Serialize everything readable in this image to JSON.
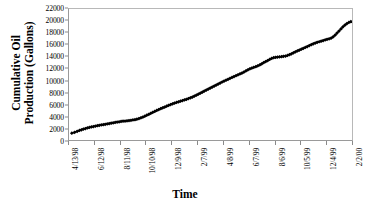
{
  "chart_data": {
    "type": "scatter",
    "title": "",
    "xlabel": "Time",
    "ylabel": "Cumulative Oil Production (Gallons)",
    "ylabel_lines": [
      "Cumulative Oil",
      "Production (Gallons)"
    ],
    "ylim": [
      0,
      22000
    ],
    "ytick_step": 2000,
    "yticks": [
      0,
      2000,
      4000,
      6000,
      8000,
      10000,
      12000,
      14000,
      16000,
      18000,
      20000,
      22000
    ],
    "ytick_labels": [
      "0",
      "2000",
      "4000",
      "6000",
      "8000",
      "10000",
      "12000",
      "14000",
      "16000",
      "18000",
      "20000",
      "22000"
    ],
    "xticks": [
      "4/13/98",
      "6/12/98",
      "8/11/98",
      "10/10/98",
      "12/9/98",
      "2/7/99",
      "4/8/99",
      "6/7/99",
      "8/6/99",
      "10/5/99",
      "12/4/99",
      "2/2/00"
    ],
    "xlim": [
      "4/13/98",
      "2/2/00"
    ],
    "grid": false,
    "legend": false,
    "marker": "filled-diamond",
    "marker_color": "#000000",
    "series": [
      {
        "name": "Cumulative Oil Production",
        "x_fraction": [
          0.01,
          0.02,
          0.029,
          0.037,
          0.044,
          0.051,
          0.058,
          0.065,
          0.072,
          0.079,
          0.086,
          0.093,
          0.1,
          0.107,
          0.114,
          0.121,
          0.128,
          0.135,
          0.142,
          0.149,
          0.156,
          0.163,
          0.17,
          0.177,
          0.184,
          0.191,
          0.198,
          0.205,
          0.212,
          0.219,
          0.226,
          0.233,
          0.24,
          0.247,
          0.254,
          0.261,
          0.268,
          0.275,
          0.282,
          0.289,
          0.296,
          0.303,
          0.31,
          0.317,
          0.324,
          0.331,
          0.338,
          0.345,
          0.352,
          0.359,
          0.366,
          0.373,
          0.38,
          0.387,
          0.394,
          0.401,
          0.408,
          0.415,
          0.422,
          0.429,
          0.436,
          0.443,
          0.45,
          0.457,
          0.464,
          0.471,
          0.478,
          0.485,
          0.492,
          0.499,
          0.506,
          0.513,
          0.52,
          0.527,
          0.534,
          0.541,
          0.548,
          0.555,
          0.562,
          0.569,
          0.576,
          0.583,
          0.59,
          0.597,
          0.604,
          0.611,
          0.618,
          0.625,
          0.632,
          0.639,
          0.646,
          0.653,
          0.66,
          0.667,
          0.674,
          0.681,
          0.688,
          0.695,
          0.702,
          0.709,
          0.716,
          0.723,
          0.73,
          0.737,
          0.744,
          0.751,
          0.758,
          0.765,
          0.772,
          0.779,
          0.786,
          0.793,
          0.8,
          0.807,
          0.814,
          0.821,
          0.828,
          0.835,
          0.842,
          0.849,
          0.856,
          0.863,
          0.87,
          0.877,
          0.884,
          0.891,
          0.898,
          0.905,
          0.912,
          0.919,
          0.926,
          0.933,
          0.94,
          0.947,
          0.954,
          0.961,
          0.968,
          0.975,
          0.982,
          0.989,
          0.996
        ],
        "y_values": [
          1150,
          1300,
          1450,
          1600,
          1720,
          1830,
          1930,
          2020,
          2110,
          2190,
          2260,
          2330,
          2400,
          2460,
          2520,
          2580,
          2640,
          2700,
          2760,
          2820,
          2880,
          2950,
          3010,
          3060,
          3110,
          3150,
          3190,
          3230,
          3270,
          3310,
          3360,
          3420,
          3500,
          3600,
          3720,
          3850,
          4000,
          4160,
          4320,
          4480,
          4640,
          4800,
          4960,
          5110,
          5260,
          5400,
          5540,
          5680,
          5820,
          5950,
          6080,
          6200,
          6310,
          6420,
          6520,
          6620,
          6720,
          6830,
          6950,
          7080,
          7220,
          7370,
          7530,
          7700,
          7870,
          8040,
          8210,
          8380,
          8550,
          8720,
          8890,
          9060,
          9230,
          9400,
          9570,
          9740,
          9900,
          10050,
          10200,
          10350,
          10500,
          10650,
          10800,
          10950,
          11100,
          11250,
          11400,
          11600,
          11780,
          11950,
          12080,
          12200,
          12320,
          12450,
          12600,
          12800,
          13000,
          13180,
          13350,
          13520,
          13700,
          13830,
          13880,
          13920,
          13960,
          14000,
          14050,
          14100,
          14200,
          14320,
          14470,
          14650,
          14800,
          14950,
          15100,
          15250,
          15400,
          15550,
          15700,
          15850,
          16000,
          16150,
          16280,
          16400,
          16500,
          16600,
          16700,
          16800,
          16900,
          17000,
          17100,
          17300,
          17600,
          17950,
          18300,
          18650,
          19000,
          19300,
          19550,
          19750,
          19900,
          20000,
          20100,
          20200,
          20300,
          20400,
          20500,
          20650,
          20900,
          21150,
          21350,
          21500,
          21650,
          21800,
          21900
        ]
      }
    ],
    "notable_features": [
      {
        "type": "step-jump",
        "near_xtick": "12/9/98",
        "description": "small vertical step up of ~500 gallons"
      },
      {
        "type": "plateau",
        "near_xtick": "10/5/99",
        "description": "flattening before final rise"
      }
    ]
  }
}
